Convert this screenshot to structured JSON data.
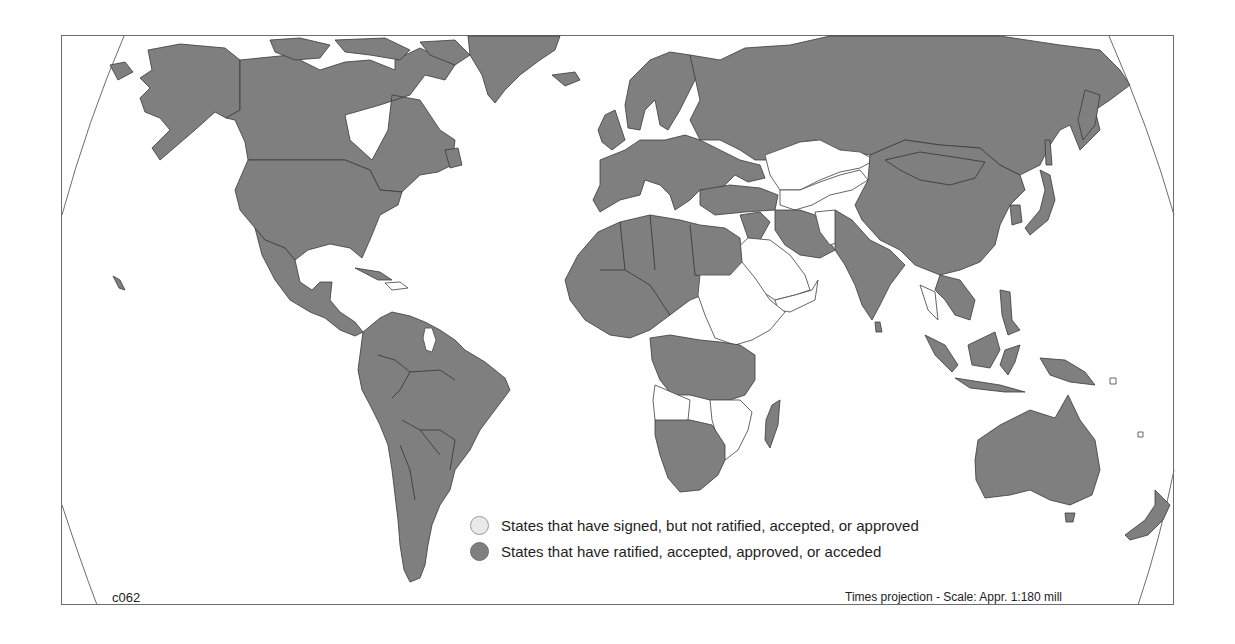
{
  "map": {
    "code": "c062",
    "projection_note": "Times projection - Scale: Appr. 1:180 mill",
    "colors": {
      "ratified": "#7f7f7f",
      "signed_only": "#ffffff",
      "background": "#ffffff",
      "frame": "#6d6d6d"
    }
  },
  "legend": {
    "items": [
      {
        "key": "signed",
        "label": "States that have signed, but not ratified, accepted, or approved",
        "swatch_color": "#e9e9e9"
      },
      {
        "key": "ratified",
        "label": "States that have ratified, accepted, approved, or acceded",
        "swatch_color": "#7f7f7f"
      }
    ]
  },
  "regions": {
    "signed_only_examples": [
      "Kazakhstan region",
      "Uzbekistan/Turkmenistan region",
      "Afghanistan",
      "Saudi Arabia",
      "Yemen",
      "Oman",
      "Sudan",
      "Ethiopia",
      "Somalia",
      "Kenya",
      "Angola",
      "Zimbabwe",
      "Mozambique",
      "Guyana",
      "Central African Republic"
    ],
    "ratified_examples": [
      "United States",
      "Canada",
      "Mexico",
      "Brazil",
      "Argentina",
      "Russia",
      "China",
      "India",
      "Europe",
      "Australia",
      "South Africa",
      "Madagascar",
      "Indonesia",
      "Japan",
      "Greenland",
      "New Zealand"
    ]
  }
}
